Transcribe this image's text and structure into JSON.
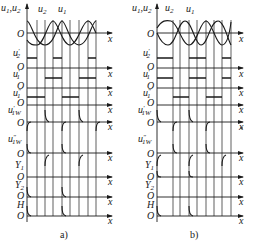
{
  "figure": {
    "panels": [
      {
        "id": "a",
        "caption": "a)",
        "origin_x": 27,
        "axis_end_x": 112,
        "grid_x": [
          37,
          45,
          53,
          62,
          70,
          79,
          88,
          96
        ],
        "sine_labels": {
          "y_axis": "u1,u2",
          "curve_u2": "u2",
          "curve_u1": "u1"
        }
      },
      {
        "id": "b",
        "caption": "b)",
        "origin_x": 157,
        "axis_end_x": 243,
        "grid_x": [
          173,
          180,
          189,
          197,
          206,
          214,
          222,
          231
        ],
        "sine_labels": {
          "y_axis": "u1,u2",
          "curve_u2": "u2",
          "curve_u1": "u1"
        }
      }
    ],
    "rows": [
      {
        "signal": "u1,u2",
        "axis_y": 33,
        "origin": "O",
        "x_label": "x"
      },
      {
        "signal": "u2'",
        "axis_y": 68,
        "origin": "O",
        "x_label": "x"
      },
      {
        "signal": "u1'",
        "axis_y": 88,
        "origin": "O",
        "x_label": "x"
      },
      {
        "signal": "u1''",
        "axis_y": 105,
        "origin": "O",
        "x_label": "x"
      },
      {
        "signal": "u1W'",
        "axis_y": 122,
        "origin": "O",
        "x_label": "x"
      },
      {
        "signal": "u1W''",
        "axis_y": 153,
        "origin": "O",
        "x_label": "x"
      },
      {
        "signal": "Y1",
        "axis_y": 177,
        "origin": "O",
        "x_label": "x"
      },
      {
        "signal": "Y2",
        "axis_y": 197,
        "origin": "O",
        "x_label": "x"
      },
      {
        "signal": "H",
        "axis_y": 216,
        "origin": "O",
        "x_label": "x"
      }
    ],
    "text": {
      "origin": "O",
      "x": "x",
      "u": "u",
      "sub1": "1",
      "sub2": "2",
      "sub1W": "1W",
      "comma": ",",
      "prime": "′",
      "dprime": "″",
      "Y": "Y",
      "H": "H",
      "caption_a": "a)",
      "caption_b": "b)"
    },
    "colors": {
      "ink": "#1a1a1a",
      "background": "#ffffff"
    }
  }
}
